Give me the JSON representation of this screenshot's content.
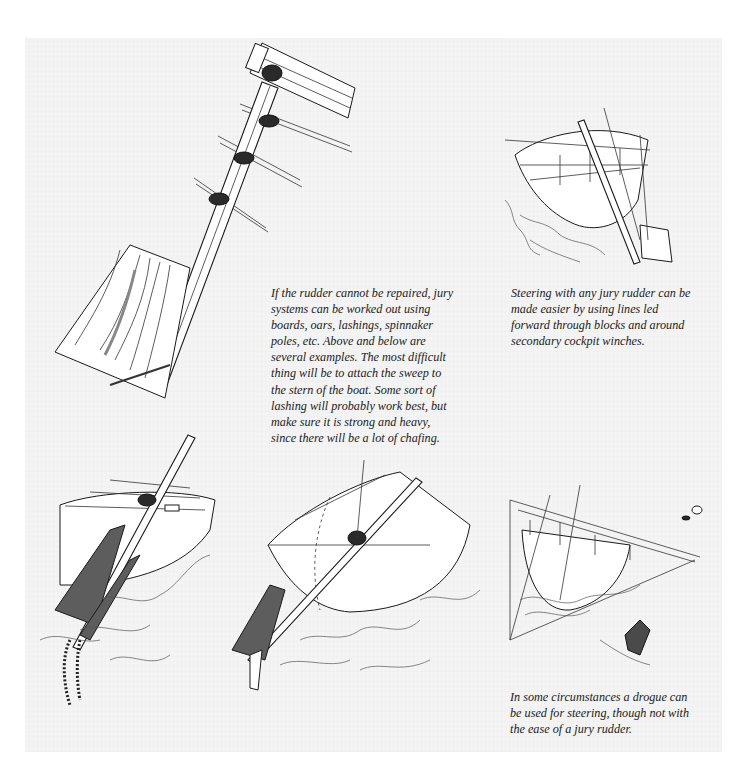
{
  "page": {
    "background_color": "#f4f4f4",
    "margin_color": "#ffffff",
    "text_color": "#222222",
    "wood_fill_color": "#5d5d5d"
  },
  "illustrations": [
    {
      "id": "jury-rudder-board-on-spinnaker-pole",
      "description": "Board lashed to pole through stern pulpit rails"
    },
    {
      "id": "jury-rudder-steering-lines",
      "description": "Stern view of boat with jury rudder and steering lines"
    },
    {
      "id": "jury-rudder-oar-with-chain",
      "description": "Oar-type jury rudder with chain weight at stern"
    },
    {
      "id": "jury-rudder-sweep-at-stern",
      "description": "Sweep lashed at stern of boat"
    },
    {
      "id": "drogue-steering",
      "description": "Drogue towed astern with bridle lines for steering"
    }
  ],
  "captions": {
    "main": {
      "lines": [
        "If the rudder cannot be repaired, jury",
        "systems can be worked out using",
        "boards, oars, lashings, spinnaker",
        "poles, etc. Above and below are",
        "several examples. The most difficult",
        "thing will be to attach the sweep to",
        "the stern of the boat. Some sort of",
        "lashing will probably work best, but",
        "make sure it is strong and heavy,",
        "since there will be a lot of chafing."
      ]
    },
    "steering_lines": {
      "lines": [
        "Steering with any jury rudder can be",
        "made easier by using lines led",
        "forward through blocks and around",
        "secondary cockpit winches."
      ]
    },
    "drogue": {
      "lines": [
        "In some circumstances a drogue can",
        "be used for steering, though not with",
        "the ease of a jury rudder."
      ]
    }
  }
}
